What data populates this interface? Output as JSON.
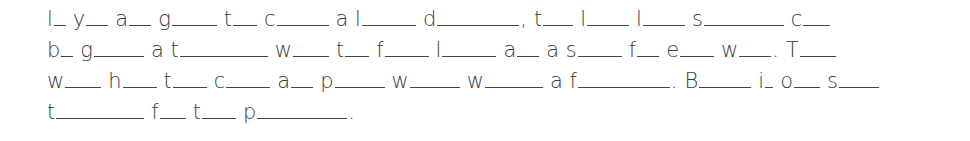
{
  "puzzle": {
    "lines": [
      [
        {
          "pre": "",
          "letter": "l",
          "blank": 12,
          "punct": ""
        },
        {
          "pre": "",
          "letter": "y",
          "blank": 22,
          "punct": ""
        },
        {
          "pre": "",
          "letter": "a",
          "blank": 22,
          "punct": ""
        },
        {
          "pre": "",
          "letter": "g",
          "blank": 45,
          "punct": ""
        },
        {
          "pre": "",
          "letter": "t",
          "blank": 24,
          "punct": ""
        },
        {
          "pre": "",
          "letter": "c",
          "blank": 52,
          "punct": ""
        },
        {
          "pre": "a ",
          "letter": "l",
          "blank": 54,
          "punct": ""
        },
        {
          "pre": "",
          "letter": "d",
          "blank": 82,
          "punct": ","
        },
        {
          "pre": "",
          "letter": "t",
          "blank": 30,
          "punct": ""
        },
        {
          "pre": "",
          "letter": "l",
          "blank": 42,
          "punct": ""
        },
        {
          "pre": "",
          "letter": "l",
          "blank": 42,
          "punct": ""
        },
        {
          "pre": "",
          "letter": "s",
          "blank": 80,
          "punct": ""
        },
        {
          "pre": "",
          "letter": "c",
          "blank": 27,
          "punct": ""
        }
      ],
      [
        {
          "pre": "",
          "letter": "b",
          "blank": 12,
          "punct": ""
        },
        {
          "pre": "",
          "letter": "g",
          "blank": 50,
          "punct": ""
        },
        {
          "pre": "a ",
          "letter": "t",
          "blank": 88,
          "punct": ""
        },
        {
          "pre": "",
          "letter": "w",
          "blank": 36,
          "punct": ""
        },
        {
          "pre": "",
          "letter": "t",
          "blank": 24,
          "punct": ""
        },
        {
          "pre": "",
          "letter": "f",
          "blank": 44,
          "punct": ""
        },
        {
          "pre": "",
          "letter": "l",
          "blank": 54,
          "punct": ""
        },
        {
          "pre": "",
          "letter": "a",
          "blank": 22,
          "punct": ""
        },
        {
          "pre": "a ",
          "letter": "s",
          "blank": 44,
          "punct": ""
        },
        {
          "pre": "",
          "letter": "f",
          "blank": 22,
          "punct": ""
        },
        {
          "pre": "",
          "letter": "e",
          "blank": 34,
          "punct": ""
        },
        {
          "pre": "",
          "letter": "w",
          "blank": 32,
          "punct": "."
        },
        {
          "pre": "",
          "letter": "T",
          "blank": 36,
          "punct": ""
        }
      ],
      [
        {
          "pre": "",
          "letter": "w",
          "blank": 36,
          "punct": ""
        },
        {
          "pre": "",
          "letter": "h",
          "blank": 34,
          "punct": ""
        },
        {
          "pre": "",
          "letter": "t",
          "blank": 34,
          "punct": ""
        },
        {
          "pre": "",
          "letter": "c",
          "blank": 44,
          "punct": ""
        },
        {
          "pre": "",
          "letter": "a",
          "blank": 22,
          "punct": ""
        },
        {
          "pre": "",
          "letter": "p",
          "blank": 50,
          "punct": ""
        },
        {
          "pre": "",
          "letter": "w",
          "blank": 50,
          "punct": ""
        },
        {
          "pre": "",
          "letter": "w",
          "blank": 58,
          "punct": ""
        },
        {
          "pre": "a ",
          "letter": "f",
          "blank": 92,
          "punct": "."
        },
        {
          "pre": "",
          "letter": "B",
          "blank": 52,
          "punct": ""
        },
        {
          "pre": "",
          "letter": "i",
          "blank": 8,
          "punct": ""
        },
        {
          "pre": "",
          "letter": "o",
          "blank": 26,
          "punct": ""
        },
        {
          "pre": "",
          "letter": "s",
          "blank": 40,
          "punct": ""
        }
      ],
      [
        {
          "pre": "",
          "letter": "t",
          "blank": 88,
          "punct": ""
        },
        {
          "pre": "",
          "letter": "f",
          "blank": 26,
          "punct": ""
        },
        {
          "pre": "",
          "letter": "t",
          "blank": 34,
          "punct": ""
        },
        {
          "pre": "",
          "letter": "p",
          "blank": 90,
          "punct": "."
        }
      ]
    ]
  }
}
